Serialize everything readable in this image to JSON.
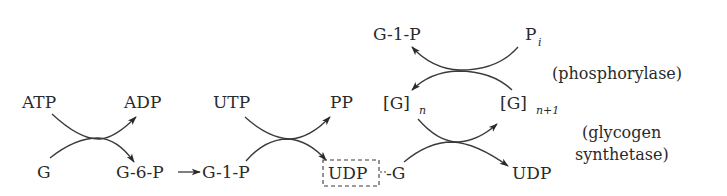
{
  "diagram": {
    "nodes": {
      "atp": "ATP",
      "adp": "ADP",
      "g": "G",
      "g6p": "G-6-P",
      "g1p_a": "G-1-P",
      "utp": "UTP",
      "pp": "PP",
      "udp_box": "UDP",
      "udpg_suffix": "-G",
      "g1p_top": "G-1-P",
      "pi_main": "P",
      "pi_sub": "i",
      "gn_main": "[G]",
      "gn_sub": "n",
      "gn1_main": "[G]",
      "gn1_sub": "n+1",
      "udp_out": "UDP"
    },
    "enzymes": {
      "phosphorylase": "(phosphorylase)",
      "synthetase_line1": "(glycogen",
      "synthetase_line2": "synthetase)"
    },
    "reactions": [
      {
        "inputs": [
          "ATP",
          "G"
        ],
        "outputs": [
          "ADP",
          "G-6-P"
        ]
      },
      {
        "inputs": [
          "G-6-P"
        ],
        "outputs": [
          "G-1-P"
        ]
      },
      {
        "inputs": [
          "UTP",
          "G-1-P"
        ],
        "outputs": [
          "PP",
          "UDP-G"
        ]
      },
      {
        "inputs": [
          "UDP-G",
          "[G]n"
        ],
        "outputs": [
          "[G]n+1",
          "UDP"
        ],
        "enzyme": "glycogen synthetase"
      },
      {
        "inputs": [
          "Pi",
          "[G]n+1"
        ],
        "outputs": [
          "G-1-P",
          "[G]n"
        ],
        "enzyme": "phosphorylase"
      }
    ]
  }
}
